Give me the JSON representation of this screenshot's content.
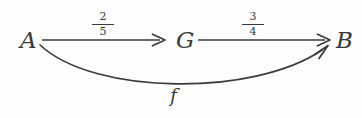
{
  "diagram": {
    "type": "commutative-diagram",
    "background_color": "#fdfdfd",
    "stroke_color": "#3a3a3a",
    "nodes": [
      {
        "id": "A",
        "label": "A"
      },
      {
        "id": "G",
        "label": "G"
      },
      {
        "id": "B",
        "label": "B"
      }
    ],
    "edges": [
      {
        "id": "a-to-g",
        "from": "A",
        "to": "G",
        "shape": "straight",
        "label_numerator": "2",
        "label_denominator": "5",
        "label_text": "2/5"
      },
      {
        "id": "g-to-b",
        "from": "G",
        "to": "B",
        "shape": "straight",
        "label_numerator": "3",
        "label_denominator": "4",
        "label_text": "3/4"
      },
      {
        "id": "a-to-b",
        "from": "A",
        "to": "B",
        "shape": "curved",
        "label_text": "f"
      }
    ]
  }
}
